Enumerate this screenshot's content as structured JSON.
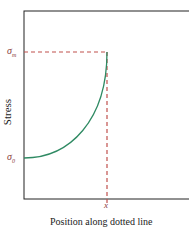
{
  "diagram": {
    "ylabel": "Stress",
    "xlabel": "Position along dotted line",
    "x_marker": "x",
    "sigma_m": {
      "symbol": "σ",
      "subscript": "m"
    },
    "sigma_0": {
      "symbol": "σ",
      "subscript": "0"
    },
    "colors": {
      "curve": "#2f8a63",
      "dashed": "#c0504d",
      "frame": "#222222"
    }
  }
}
